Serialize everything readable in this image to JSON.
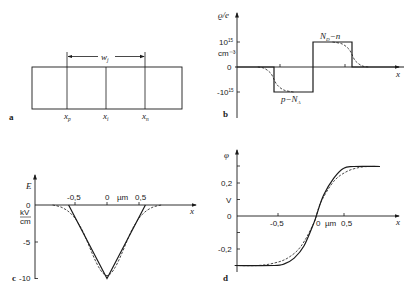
{
  "chart_data": [
    {
      "panel": "a",
      "type": "diagram",
      "panel_label": "a",
      "width_label": "w",
      "width_label_sub": "j",
      "markers": [
        {
          "name": "x",
          "sub": "p"
        },
        {
          "name": "x",
          "sub": "i"
        },
        {
          "name": "x",
          "sub": "n"
        }
      ]
    },
    {
      "panel": "b",
      "type": "line",
      "panel_label": "b",
      "ylabel": "ϱ/e",
      "xlabel": "x",
      "yticks": [
        {
          "value": 1,
          "label": "10",
          "sup": "15"
        },
        {
          "value": 0,
          "label": "0"
        },
        {
          "value": -1,
          "label": "-10",
          "sup": "15"
        }
      ],
      "yunit": "cm⁻³",
      "ylim": [
        -1.9,
        2.0
      ],
      "xlim": [
        -1.2,
        1.4
      ],
      "annotations": [
        {
          "text": "N",
          "sub": "D",
          "suffix": "−n"
        },
        {
          "text": "p−N",
          "sub": "A"
        }
      ],
      "series": [
        {
          "name": "abrupt",
          "style": "solid",
          "points": [
            [
              -1.2,
              0
            ],
            [
              -0.6,
              0
            ],
            [
              -0.6,
              -1
            ],
            [
              0,
              -1
            ],
            [
              0,
              1
            ],
            [
              0.6,
              1
            ],
            [
              0.6,
              0
            ],
            [
              1.4,
              0
            ]
          ]
        },
        {
          "name": "smooth",
          "style": "dashed",
          "points": [
            [
              -0.85,
              0
            ],
            [
              -0.75,
              -0.05
            ],
            [
              -0.65,
              -0.25
            ],
            [
              -0.6,
              -0.5
            ],
            [
              -0.55,
              -0.72
            ],
            [
              -0.45,
              -0.92
            ],
            [
              -0.3,
              -1.0
            ]
          ]
        },
        {
          "name": "smooth-right",
          "style": "dashed",
          "points": [
            [
              0.3,
              1.0
            ],
            [
              0.45,
              0.92
            ],
            [
              0.55,
              0.72
            ],
            [
              0.6,
              0.5
            ],
            [
              0.65,
              0.25
            ],
            [
              0.75,
              0.05
            ],
            [
              0.85,
              0
            ]
          ]
        }
      ]
    },
    {
      "panel": "c",
      "type": "line",
      "panel_label": "c",
      "ylabel": "E",
      "yunit": "kV/cm",
      "xlabel": "x",
      "xunit": "µm",
      "xticks": [
        {
          "value": -0.5,
          "label": "-0,5"
        },
        {
          "value": 0,
          "label": "0"
        },
        {
          "value": 0.5,
          "label": "0,5"
        }
      ],
      "yticks": [
        {
          "value": 0,
          "label": "0"
        },
        {
          "value": -5,
          "label": "-5"
        },
        {
          "value": -10,
          "label": "-10"
        }
      ],
      "xlim": [
        -1.1,
        1.35
      ],
      "ylim": [
        -10,
        1.2
      ],
      "series": [
        {
          "name": "abrupt",
          "style": "solid",
          "points": [
            [
              -0.6,
              0
            ],
            [
              0,
              -10
            ],
            [
              0.6,
              0
            ]
          ]
        },
        {
          "name": "smooth",
          "style": "dashed",
          "points": [
            [
              -0.85,
              0
            ],
            [
              -0.7,
              -0.35
            ],
            [
              -0.55,
              -1.3
            ],
            [
              -0.4,
              -3.2
            ],
            [
              0,
              -9.6
            ],
            [
              0.4,
              -3.2
            ],
            [
              0.55,
              -1.3
            ],
            [
              0.7,
              -0.35
            ],
            [
              0.85,
              0
            ]
          ]
        }
      ]
    },
    {
      "panel": "d",
      "type": "line",
      "panel_label": "d",
      "ylabel": "φ",
      "yunit": "V",
      "xlabel": "x",
      "xunit": "µm",
      "xticks": [
        {
          "value": -0.5,
          "label": "-0,5"
        },
        {
          "value": 0,
          "label": "0"
        },
        {
          "value": 0.5,
          "label": "0,5"
        }
      ],
      "yticks": [
        {
          "value": 0.2,
          "label": "0,2"
        },
        {
          "value": 0,
          "label": "0"
        },
        {
          "value": -0.2,
          "label": "-0,2"
        }
      ],
      "xlim": [
        -1.25,
        1.4
      ],
      "ylim": [
        -0.34,
        0.38
      ],
      "series": [
        {
          "name": "abrupt",
          "style": "solid",
          "points": [
            [
              -1.2,
              -0.3
            ],
            [
              -0.6,
              -0.3
            ],
            [
              -0.45,
              -0.29
            ],
            [
              -0.3,
              -0.255
            ],
            [
              -0.15,
              -0.18
            ],
            [
              0,
              -0.04
            ],
            [
              0.05,
              0.02
            ],
            [
              0.15,
              0.13
            ],
            [
              0.3,
              0.23
            ],
            [
              0.45,
              0.29
            ],
            [
              0.6,
              0.3
            ],
            [
              1.0,
              0.3
            ]
          ]
        },
        {
          "name": "smooth",
          "style": "dashed",
          "points": [
            [
              -1.2,
              -0.3
            ],
            [
              -0.85,
              -0.3
            ],
            [
              -0.6,
              -0.285
            ],
            [
              -0.4,
              -0.255
            ],
            [
              -0.2,
              -0.185
            ],
            [
              0,
              -0.04
            ],
            [
              0.1,
              0.08
            ],
            [
              0.3,
              0.21
            ],
            [
              0.5,
              0.27
            ],
            [
              0.7,
              0.295
            ],
            [
              0.85,
              0.3
            ],
            [
              1.0,
              0.3
            ]
          ]
        }
      ]
    }
  ]
}
